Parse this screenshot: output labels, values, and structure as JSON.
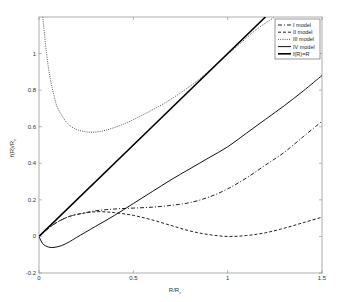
{
  "chart_data": {
    "type": "line",
    "title": "",
    "xlabel": "R/R_c",
    "ylabel": "f(R)/R_c",
    "xlim": [
      0,
      1.5
    ],
    "ylim": [
      -0.2,
      1.2
    ],
    "xticks": [
      0,
      0.5,
      1,
      1.5
    ],
    "xtick_labels": [
      "0",
      "0.5",
      "1",
      "1.5"
    ],
    "yticks": [
      -0.2,
      0,
      0.2,
      0.4,
      0.6,
      0.8,
      1
    ],
    "ytick_labels": [
      "-0.2",
      "0",
      "0.2",
      "0.4",
      "0.6",
      "0.8",
      "1"
    ],
    "grid": false,
    "legend_position": "upper right",
    "series": [
      {
        "name": "I model",
        "style": "dashdot",
        "x": [
          0,
          0.05,
          0.1,
          0.15,
          0.2,
          0.3,
          0.4,
          0.5,
          0.6,
          0.7,
          0.8,
          0.9,
          1.0,
          1.1,
          1.2,
          1.3,
          1.4,
          1.5
        ],
        "y": [
          0,
          0.045,
          0.08,
          0.105,
          0.12,
          0.14,
          0.15,
          0.155,
          0.16,
          0.17,
          0.185,
          0.215,
          0.26,
          0.32,
          0.39,
          0.46,
          0.545,
          0.63
        ]
      },
      {
        "name": "II model",
        "style": "dashed",
        "x": [
          0,
          0.05,
          0.1,
          0.15,
          0.2,
          0.3,
          0.4,
          0.5,
          0.6,
          0.7,
          0.8,
          0.9,
          1.0,
          1.1,
          1.2,
          1.3,
          1.4,
          1.5
        ],
        "y": [
          0,
          0.045,
          0.08,
          0.105,
          0.12,
          0.135,
          0.13,
          0.115,
          0.09,
          0.06,
          0.03,
          0.01,
          0.0,
          0.005,
          0.02,
          0.045,
          0.075,
          0.105
        ]
      },
      {
        "name": "III model",
        "style": "dotted",
        "x": [
          0.02,
          0.04,
          0.06,
          0.08,
          0.1,
          0.15,
          0.2,
          0.27,
          0.35,
          0.45,
          0.55,
          0.65,
          0.75,
          0.85,
          0.95,
          1.05,
          1.15,
          1.25
        ],
        "y": [
          1.2,
          1.0,
          0.86,
          0.77,
          0.7,
          0.62,
          0.585,
          0.57,
          0.58,
          0.615,
          0.665,
          0.72,
          0.785,
          0.86,
          0.95,
          1.04,
          1.13,
          1.2
        ]
      },
      {
        "name": "IV model",
        "style": "solid-thin",
        "x": [
          0,
          0.02,
          0.05,
          0.08,
          0.12,
          0.16,
          0.2,
          0.3,
          0.4,
          0.5,
          0.6,
          0.7,
          0.8,
          0.9,
          1.0,
          1.1,
          1.2,
          1.3,
          1.4,
          1.5
        ],
        "y": [
          0,
          -0.04,
          -0.058,
          -0.06,
          -0.05,
          -0.03,
          -0.005,
          0.055,
          0.115,
          0.18,
          0.245,
          0.31,
          0.37,
          0.43,
          0.49,
          0.565,
          0.64,
          0.715,
          0.795,
          0.88
        ]
      },
      {
        "name": "f(R)=R",
        "style": "solid-thick",
        "x": [
          0,
          1.2
        ],
        "y": [
          0,
          1.2
        ]
      }
    ]
  },
  "legend": {
    "items": [
      "I model",
      "II model",
      "III model",
      "IV model",
      "f(R)=R"
    ]
  },
  "axes": {
    "xlabel_main": "R/R",
    "xlabel_sub": "c",
    "ylabel_main": "f(R)/R",
    "ylabel_sub": "c"
  }
}
